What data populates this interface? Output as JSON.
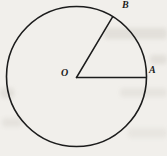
{
  "figure": {
    "type": "circle-with-two-radii",
    "labels": {
      "center": "O",
      "right_point": "A",
      "upper_point": "B"
    },
    "colors": {
      "stroke": "#1c1c1c",
      "background": "#f1efeb"
    }
  }
}
